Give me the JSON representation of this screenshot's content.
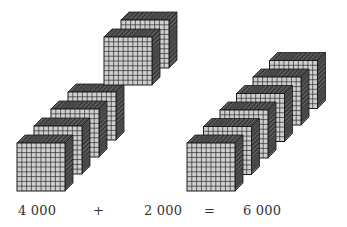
{
  "diagram": {
    "colors": {
      "front_face": "#cfcfcf",
      "grid_line": "#2b2b2b",
      "top_face": "#4a4a4a",
      "side_face": "#3a3a3a",
      "hatch": "#8a8a8a",
      "edge": "#1a1a1a",
      "text": "#333333"
    },
    "cube": {
      "size": 48,
      "depth": 8,
      "grid": 10
    },
    "groups": [
      {
        "name": "thousands-group-a-lower",
        "count": 4,
        "front_x": 17,
        "front_y": 143,
        "step_x": 17,
        "step_y": -17
      },
      {
        "name": "thousands-group-a-upper",
        "count": 2,
        "front_x": 104,
        "front_y": 37,
        "step_x": 17,
        "step_y": -17
      },
      {
        "name": "thousands-group-sum",
        "count": 6,
        "front_x": 187,
        "front_y": 143,
        "step_x": 16.5,
        "step_y": -16.5
      }
    ],
    "equation": {
      "addend1": "4 000",
      "plus": "+",
      "addend2": "2 000",
      "equals": "=",
      "sum": "6 000"
    },
    "label_positions": {
      "addend1_x": 18,
      "plus_x": 93,
      "addend2_x": 144,
      "equals_x": 204,
      "sum_x": 243
    }
  }
}
